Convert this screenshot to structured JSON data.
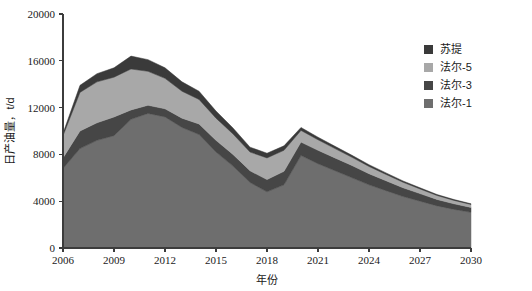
{
  "chart_data": {
    "type": "area",
    "stacked": true,
    "title": "",
    "xlabel": "年份",
    "ylabel": "日产油量，t/d",
    "xlim": [
      2006,
      2030
    ],
    "ylim": [
      0,
      20000
    ],
    "ytick_values": [
      0,
      4000,
      8000,
      12000,
      16000,
      20000
    ],
    "ytick_labels": [
      "0",
      "4000",
      "8000",
      "12000",
      "16000",
      "20000"
    ],
    "xtick_values": [
      2006,
      2009,
      2012,
      2015,
      2018,
      2021,
      2024,
      2027,
      2030
    ],
    "xtick_labels": [
      "2006",
      "2009",
      "2012",
      "2015",
      "2018",
      "2021",
      "2024",
      "2027",
      "2030"
    ],
    "grid": false,
    "legend_position": "top-right",
    "x": [
      2006,
      2007,
      2008,
      2009,
      2010,
      2011,
      2012,
      2013,
      2014,
      2015,
      2016,
      2017,
      2018,
      2019,
      2020,
      2021,
      2022,
      2023,
      2024,
      2025,
      2026,
      2027,
      2028,
      2029,
      2030
    ],
    "series": [
      {
        "name": "法尔-1",
        "color": "#6e6e6e",
        "values": [
          6800,
          8500,
          9200,
          9600,
          11000,
          11500,
          11200,
          10300,
          9700,
          8200,
          7000,
          5600,
          4800,
          5400,
          7900,
          7200,
          6600,
          6000,
          5400,
          4900,
          4400,
          4000,
          3600,
          3300,
          3050
        ]
      },
      {
        "name": "法尔-3",
        "color": "#464646",
        "values": [
          900,
          1500,
          1500,
          1600,
          800,
          700,
          700,
          800,
          900,
          1000,
          1000,
          1000,
          1050,
          1150,
          1150,
          1150,
          1100,
          1050,
          950,
          850,
          750,
          650,
          550,
          480,
          420
        ]
      },
      {
        "name": "法尔-5",
        "color": "#a8a8a8",
        "values": [
          1900,
          3300,
          3500,
          3400,
          3500,
          2900,
          2600,
          2300,
          2100,
          1900,
          1750,
          1600,
          1850,
          1800,
          1000,
          900,
          800,
          700,
          620,
          540,
          470,
          400,
          340,
          290,
          250
        ]
      },
      {
        "name": "苏提",
        "color": "#3a3a3a",
        "values": [
          200,
          600,
          700,
          800,
          1100,
          1000,
          900,
          800,
          700,
          600,
          500,
          420,
          400,
          380,
          250,
          220,
          190,
          170,
          150,
          130,
          110,
          95,
          80,
          70,
          60
        ]
      }
    ],
    "legend_entries": [
      {
        "label": "苏提",
        "color": "#3a3a3a"
      },
      {
        "label": "法尔-5",
        "color": "#a8a8a8"
      },
      {
        "label": "法尔-3",
        "color": "#464646"
      },
      {
        "label": "法尔-1",
        "color": "#6e6e6e"
      }
    ]
  }
}
